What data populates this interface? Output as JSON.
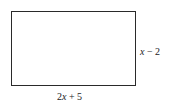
{
  "diagram": {
    "shape": "rectangle",
    "labels": {
      "height": {
        "coef": "",
        "var": "x",
        "rest": " − 2"
      },
      "width": {
        "coef": "2",
        "var": "x",
        "rest": " + 5"
      }
    }
  }
}
